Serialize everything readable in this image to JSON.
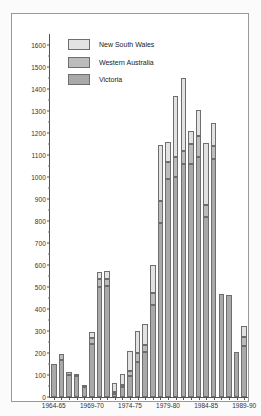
{
  "chart_data": {
    "type": "bar",
    "stacked": true,
    "title": "",
    "xlabel": "",
    "ylabel": "",
    "ylim": [
      0,
      1650
    ],
    "ytick_step": 100,
    "yticks": [
      0,
      100,
      200,
      300,
      400,
      500,
      600,
      700,
      800,
      900,
      1000,
      1100,
      1200,
      1300,
      1400,
      1500,
      1600
    ],
    "grid": false,
    "legend_position": "top-left",
    "categories": [
      "1964-65",
      "1965-66",
      "1966-67",
      "1967-68",
      "1968-69",
      "1969-70",
      "1970-71",
      "1971-72",
      "1972-73",
      "1973-74",
      "1974-75",
      "1975-76",
      "1976-77",
      "1977-78",
      "1978-79",
      "1979-80",
      "1980-81",
      "1981-82",
      "1982-83",
      "1983-84",
      "1984-85",
      "1985-86",
      "1986-87",
      "1987-88",
      "1988-89",
      "1989-90"
    ],
    "xtick_labels": [
      "1964-65",
      "1969-70",
      "1974-75",
      "1979-80",
      "1984-85",
      "1989-90"
    ],
    "xtick_indices": [
      0,
      5,
      10,
      15,
      20,
      25
    ],
    "series": [
      {
        "name": "Victoria",
        "color": "#a9a9a9",
        "values": [
          150,
          170,
          100,
          95,
          45,
          240,
          500,
          505,
          15,
          45,
          95,
          160,
          205,
          420,
          790,
          990,
          1000,
          1060,
          1060,
          1090,
          820,
          1080,
          470,
          465,
          205,
          230
        ]
      },
      {
        "name": "Western Australia",
        "color": "#bcbcbc",
        "values": [
          0,
          25,
          15,
          10,
          5,
          30,
          35,
          30,
          5,
          10,
          25,
          40,
          30,
          55,
          100,
          80,
          90,
          60,
          90,
          95,
          55,
          60,
          0,
          0,
          0,
          45
        ]
      },
      {
        "name": "New South Wales",
        "color": "#e2e2e2",
        "values": [
          0,
          0,
          0,
          0,
          0,
          25,
          35,
          40,
          40,
          50,
          90,
          100,
          95,
          125,
          255,
          90,
          280,
          330,
          60,
          120,
          280,
          105,
          0,
          0,
          0,
          50
        ]
      }
    ]
  },
  "legend": {
    "entries": [
      {
        "label": "New South Wales",
        "swatch": "#e2e2e2"
      },
      {
        "label": "Western Australia",
        "swatch": "#bcbcbc"
      },
      {
        "label": "Victoria",
        "swatch": "#a9a9a9"
      }
    ]
  }
}
